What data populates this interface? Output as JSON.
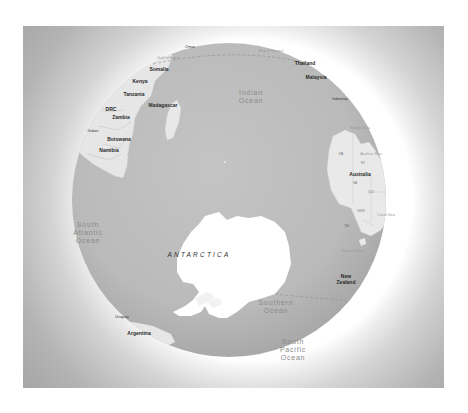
{
  "map": {
    "view": "globe",
    "theme": "grayscale",
    "colors": {
      "ocean": "#bdbdbd",
      "land": "#ededed",
      "antarctica": "#ffffff",
      "halo": "#ffffff",
      "background": "#9a9a9a",
      "boundary": "#8c8c8c"
    },
    "labels": {
      "continent": {
        "antarctica": "ANTARCTICA"
      },
      "oceans": {
        "indian": [
          "Indian",
          "Ocean"
        ],
        "south_atlantic_left": [
          "South",
          "Atlantic",
          "Ocean"
        ],
        "southern": [
          "Southern",
          "Ocean"
        ],
        "south_pacific": [
          "South",
          "Pacific",
          "Ocean"
        ]
      },
      "seas": {
        "gulf_of_aden": "Gulf of Aden",
        "bay_of_bengal": "Bay of Bengal",
        "banda_sea": "Banda Sea",
        "arafura_sea": "Arafura Sea",
        "tasman_sea": "Tasman Sea",
        "coral_sea": "Coral Sea"
      },
      "countries": {
        "oman": "Oman",
        "somalia": "Somalia",
        "kenya": "Kenya",
        "tanzania": "Tanzania",
        "madagascar": "Madagascar",
        "drc": "DRC",
        "zambia": "Zambia",
        "gabon": "Gabon",
        "botswana": "Botswana",
        "namibia": "Namibia",
        "thailand": "Thailand",
        "malaysia": "Malaysia",
        "indonesia": "Indonesia",
        "australia": "Australia",
        "new_zealand": [
          "New",
          "Zealand"
        ],
        "uruguay": "Uruguay",
        "argentina": "Argentina"
      },
      "states": {
        "wa": "WA",
        "nt": "NT",
        "sa": "SA",
        "qld": "QLD",
        "nsw": "NSW",
        "tas": "TAS"
      }
    }
  }
}
